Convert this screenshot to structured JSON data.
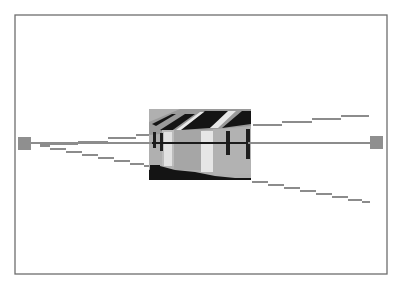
{
  "diagram": {
    "colors": {
      "background": "#ffffff",
      "frame": "#6e6e6e",
      "ray": "#8c8c8c",
      "viewpoint": "#8f8f8f",
      "photo_light": "#b4b4b4",
      "photo_mid": "#9a9a9a",
      "photo_dark": "#141414",
      "photo_highlight": "#e8e8e8"
    },
    "frame": {
      "x": 15,
      "y": 15,
      "width": 372,
      "height": 259
    },
    "viewpoints": [
      {
        "name": "left-viewpoint",
        "x": 18,
        "y": 137,
        "size": 13
      },
      {
        "name": "right-viewpoint",
        "x": 370,
        "y": 136,
        "size": 13
      }
    ],
    "axis": {
      "x1": 31,
      "y1": 143,
      "x2": 370,
      "y2": 143
    },
    "photo": {
      "x": 149,
      "y": 109,
      "width": 102,
      "height": 71
    },
    "rays": {
      "upper_left": [
        [
          31,
          145
        ],
        [
          78,
          142
        ],
        [
          108,
          138
        ],
        [
          138,
          134
        ],
        [
          160,
          130
        ]
      ],
      "lower_left": [
        [
          31,
          145
        ],
        [
          60,
          150
        ],
        [
          90,
          155
        ],
        [
          120,
          160
        ],
        [
          150,
          166
        ]
      ],
      "upper_right": [
        [
          251,
          124
        ],
        [
          282,
          121
        ],
        [
          312,
          118
        ],
        [
          340,
          116
        ],
        [
          368,
          115
        ]
      ],
      "lower_right": [
        [
          251,
          181
        ],
        [
          282,
          186
        ],
        [
          312,
          191
        ],
        [
          340,
          196
        ],
        [
          370,
          202
        ]
      ]
    }
  }
}
